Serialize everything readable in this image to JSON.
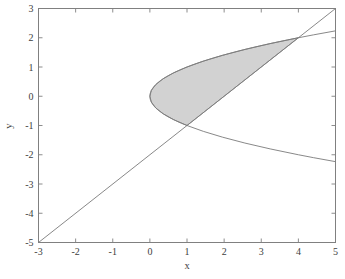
{
  "figure": {
    "background_color": "#ffffff",
    "axes_color": "#808080",
    "text_color": "#3d3d3d"
  },
  "chart_data": {
    "type": "line",
    "title": "",
    "subtitle": "",
    "xlabel": "x",
    "ylabel": "y",
    "xlim": [
      -3,
      5
    ],
    "ylim": [
      -5,
      3
    ],
    "grid": false,
    "legend": null,
    "legend_position": "none",
    "xticks": [
      -3,
      -2,
      -1,
      0,
      1,
      2,
      3,
      4,
      5
    ],
    "xticklabels": [
      "-3",
      "-2",
      "-1",
      "0",
      "1",
      "2",
      "3",
      "4",
      "5"
    ],
    "yticks": [
      -5,
      -4,
      -3,
      -2,
      -1,
      0,
      1,
      2,
      3
    ],
    "yticklabels": [
      "-5",
      "-4",
      "-3",
      "-2",
      "-1",
      "0",
      "1",
      "2",
      "3"
    ],
    "tick_direction": "in",
    "spines": [
      "left",
      "right",
      "top",
      "bottom"
    ],
    "series": [
      {
        "name": "parabola-upper-branch",
        "equation": "x = y^2",
        "color": "#7a7a7a",
        "linewidth": 0.9,
        "x": [
          0,
          0.04,
          0.16,
          0.36,
          0.64,
          1,
          1.44,
          1.96,
          2.56,
          3.24,
          4,
          4.41,
          5
        ],
        "y": [
          0,
          0.2,
          0.4,
          0.6,
          0.8,
          1,
          1.2,
          1.4,
          1.6,
          1.8,
          2,
          2.1,
          2.236
        ]
      },
      {
        "name": "parabola-lower-branch",
        "equation": "x = y^2",
        "color": "#7a7a7a",
        "linewidth": 0.9,
        "x": [
          0,
          0.04,
          0.16,
          0.36,
          0.64,
          1,
          1.44,
          1.96,
          2.56,
          3.24,
          4,
          4.41,
          5
        ],
        "y": [
          0,
          -0.2,
          -0.4,
          -0.6,
          -0.8,
          -1,
          -1.2,
          -1.4,
          -1.6,
          -1.8,
          -2,
          -2.1,
          -2.236
        ]
      },
      {
        "name": "straight-line",
        "equation": "y = x - 2",
        "color": "#7a7a7a",
        "linewidth": 0.9,
        "x": [
          -3,
          5
        ],
        "y": [
          -5,
          3
        ]
      }
    ],
    "shaded_region": {
      "name": "region-between-parabola-and-line",
      "fill_color": "#d2d2d2",
      "edge_color": "#7a7a7a",
      "description": "Region bounded by x = y^2 on the left and y = x - 2 on the right",
      "y_from": -1,
      "y_to": 2,
      "intersections": [
        {
          "x": 1,
          "y": -1
        },
        {
          "x": 4,
          "y": 2
        }
      ]
    },
    "annotations": []
  }
}
